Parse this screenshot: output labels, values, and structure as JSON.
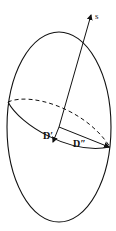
{
  "diagram": {
    "labels": {
      "axis": "s",
      "d_prime": "D′",
      "d_double_prime": "D″"
    },
    "colors": {
      "stroke": "#111111",
      "background": "#ffffff"
    }
  }
}
